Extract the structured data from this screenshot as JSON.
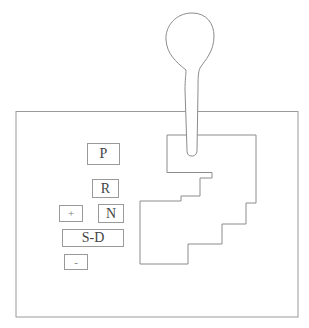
{
  "diagram": {
    "stroke_color": "#8c8c8c",
    "buttons": [
      {
        "id": "park",
        "label": "P"
      },
      {
        "id": "reverse",
        "label": "R"
      },
      {
        "id": "plus",
        "label": "+"
      },
      {
        "id": "neutral",
        "label": "N"
      },
      {
        "id": "sport-drive",
        "label": "S-D"
      },
      {
        "id": "minus",
        "label": "-"
      }
    ],
    "icons": {
      "lever": "gear-lever-icon",
      "gate": "shift-gate-icon"
    }
  }
}
